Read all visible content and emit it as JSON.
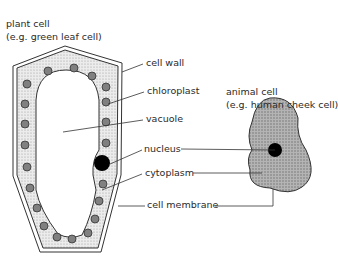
{
  "plant_cell": {
    "title": "plant cell",
    "example": "(e.g. green leaf cell)"
  },
  "animal_cell": {
    "title": "animal cell",
    "example": "(e.g. human cheek cell)"
  },
  "labels": {
    "cell_wall": "cell wall",
    "chloroplast": "chloroplast",
    "vacuole": "vacuole",
    "nucleus": "nucleus",
    "cytoplasm": "cytoplasm",
    "cell_membrane": "cell membrane"
  },
  "colors": {
    "cytoplasm_fill": "#d9d9d9",
    "animal_fill": "#a9a9a9",
    "chloroplast": "#808080",
    "nucleus": "#000000",
    "line": "#333333"
  }
}
